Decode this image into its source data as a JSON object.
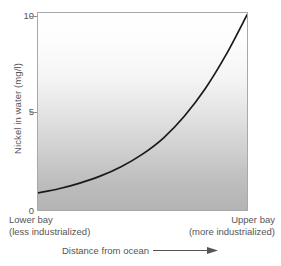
{
  "chart_data": {
    "type": "line",
    "title": "",
    "xlabel": "Distance from ocean",
    "ylabel": "Nickel in water (mg/l)",
    "ylim": [
      0,
      10.4
    ],
    "xlim": [
      0,
      100
    ],
    "y_ticks": [
      "10",
      "5",
      "0"
    ],
    "y_tick_values": [
      10,
      5,
      0
    ],
    "grid": false,
    "legend": "none",
    "x_category_left_line1": "Lower bay",
    "x_category_left_line2": "(less industrialized)",
    "x_category_right_line1": "Upper bay",
    "x_category_right_line2": "(more industrialized)",
    "series": [
      {
        "name": "Nickel concentration",
        "color": "#1a1a1a",
        "x": [
          0,
          10,
          20,
          30,
          40,
          50,
          60,
          70,
          80,
          90,
          100
        ],
        "values": [
          0.9,
          1.12,
          1.42,
          1.8,
          2.3,
          2.95,
          3.8,
          4.95,
          6.4,
          8.2,
          10.3
        ]
      }
    ],
    "annotations": {
      "x_axis_arrow": "arrow-right"
    }
  },
  "axis_title_arrow_icon": "arrow-right-icon"
}
